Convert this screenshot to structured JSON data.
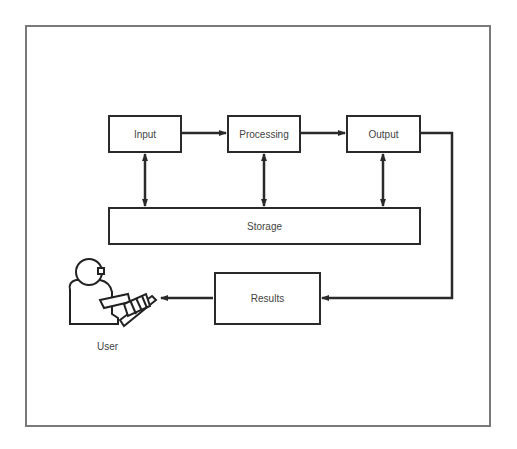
{
  "diagram": {
    "title": "",
    "nodes": {
      "input": "Input",
      "processing": "Processing",
      "output": "Output",
      "storage": "Storage",
      "results": "Results",
      "user": "User"
    },
    "edges": [
      {
        "from": "Input",
        "to": "Processing",
        "type": "arrow"
      },
      {
        "from": "Processing",
        "to": "Output",
        "type": "arrow"
      },
      {
        "from": "Input",
        "to": "Storage",
        "type": "bidirectional"
      },
      {
        "from": "Processing",
        "to": "Storage",
        "type": "bidirectional"
      },
      {
        "from": "Output",
        "to": "Storage",
        "type": "bidirectional"
      },
      {
        "from": "Output",
        "to": "Results",
        "type": "arrow"
      },
      {
        "from": "Results",
        "to": "User",
        "type": "arrow"
      }
    ],
    "colors": {
      "line": "#2a2a2a",
      "frame": "#7a7a7a",
      "text": "#444444"
    }
  }
}
